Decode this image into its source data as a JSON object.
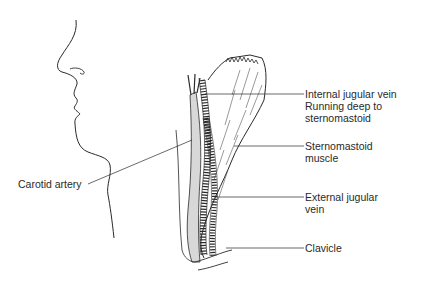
{
  "diagram": {
    "type": "anatomical-illustration",
    "labels": {
      "ijv_line1": "Internal jugular vein",
      "ijv_line2": "Running deep to",
      "ijv_line3": "sternomastoid",
      "scm_line1": "Sternomastoid",
      "scm_line2": "muscle",
      "ejv_line1": "External jugular",
      "ejv_line2": "vein",
      "clavicle": "Clavicle",
      "carotid": "Carotid artery"
    },
    "colors": {
      "line": "#2a2a2a",
      "background": "#ffffff"
    }
  }
}
